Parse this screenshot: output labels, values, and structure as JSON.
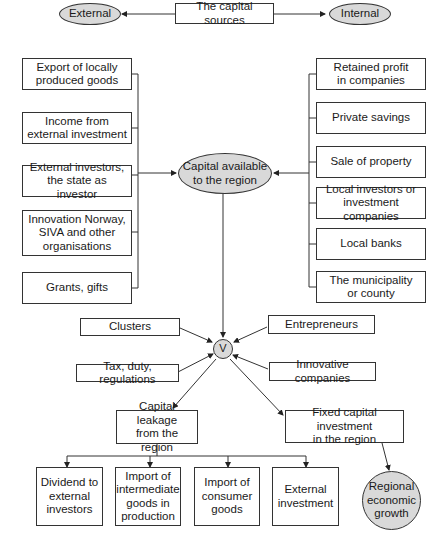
{
  "diagram": {
    "top": {
      "center": "The capital sources",
      "left_oval": "External",
      "right_oval": "Internal"
    },
    "external_sources": [
      "Export of locally\nproduced goods",
      "Income from\nexternal investment",
      "External investors,\nthe state as investor",
      "Innovation Norway,\nSIVA and other\norganisations",
      "Grants, gifts"
    ],
    "internal_sources": [
      "Retained profit\nin companies",
      "Private savings",
      "Sale of property",
      "Local investors or\ninvestment companies",
      "Local banks",
      "The municipality\nor county"
    ],
    "center_oval": "Capital available\nto the region",
    "junction": "V",
    "influences": {
      "clusters": "Clusters",
      "entrepreneurs": "Entrepreneurs",
      "tax": "Tax, duty, regulations",
      "innovative": "Innovative companies"
    },
    "leakage": "Capital leakage\nfrom the region",
    "fixed_investment": "Fixed capital investment\nin the region",
    "leakage_outputs": [
      "Dividend to\nexternal\ninvestors",
      "Import of\nintermediate\ngoods in\nproduction",
      "Import of\nconsumer\ngoods",
      "External\ninvestment"
    ],
    "growth_oval": "Regional\neconomic\ngrowth"
  }
}
